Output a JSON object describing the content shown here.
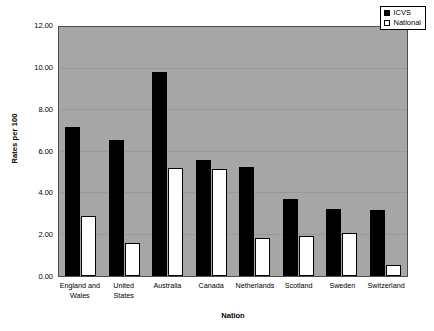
{
  "chart_data": {
    "type": "bar",
    "title": "",
    "xlabel": "Nation",
    "ylabel": "Rates per 100",
    "ylim": [
      0,
      12
    ],
    "ytick_step": 2,
    "ytick_labels": [
      "0.00",
      "2.00",
      "4.00",
      "6.00",
      "8.00",
      "10.00",
      "12.00"
    ],
    "grid": true,
    "legend_position": "top-right",
    "categories": [
      "England and Wales",
      "United States",
      "Australia",
      "Canada",
      "Netherlands",
      "Scotland",
      "Sweden",
      "Switzerland"
    ],
    "series": [
      {
        "name": "ICVS",
        "color": "#000000",
        "values": [
          7.2,
          6.55,
          9.85,
          5.6,
          5.25,
          3.7,
          3.25,
          3.2
        ]
      },
      {
        "name": "National",
        "color": "#ffffff",
        "values": [
          2.9,
          1.6,
          5.2,
          5.15,
          1.85,
          1.95,
          2.05,
          0.55
        ]
      }
    ]
  },
  "legend": {
    "items": [
      {
        "label": "ICVS"
      },
      {
        "label": "National"
      }
    ]
  },
  "colors": {
    "plot_background": "#a6a6a6",
    "page_background": "#ffffff",
    "axis": "#4d4d4d",
    "gridline": "#999999",
    "series_icvs": "#000000",
    "series_national": "#ffffff"
  }
}
